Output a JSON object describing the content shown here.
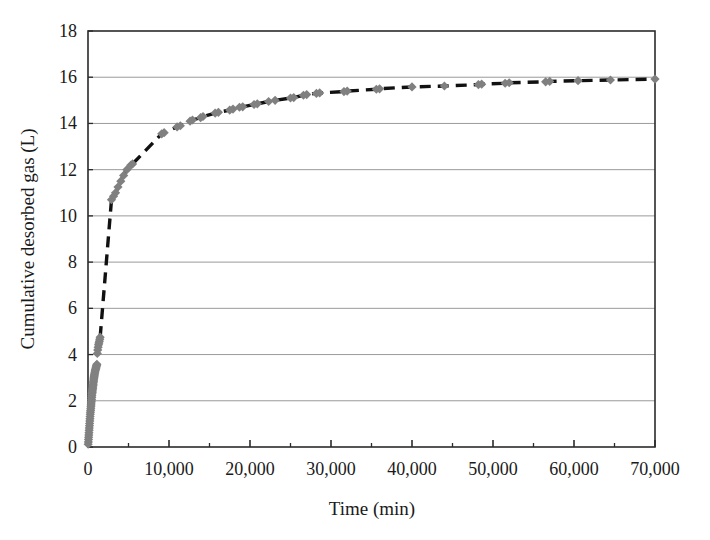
{
  "chart_data": {
    "type": "scatter",
    "title": "",
    "xlabel": "Time (min)",
    "ylabel": "Cumulative desorbed gas (L)",
    "xlim": [
      0,
      70000
    ],
    "ylim": [
      0,
      18
    ],
    "xticks": [
      0,
      10000,
      20000,
      30000,
      40000,
      50000,
      60000,
      70000
    ],
    "xtick_labels": [
      "0",
      "10,000",
      "20,000",
      "30,000",
      "40,000",
      "50,000",
      "60,000",
      "70,000"
    ],
    "xminor_tick_step": 5000,
    "yticks": [
      0,
      2,
      4,
      6,
      8,
      10,
      12,
      14,
      16,
      18
    ],
    "ytick_labels": [
      "0",
      "2",
      "4",
      "6",
      "8",
      "10",
      "12",
      "14",
      "16",
      "18"
    ],
    "grid": "horizontal",
    "grid_color": "#808080",
    "legend": "none",
    "marker": "diamond",
    "marker_color": "#808080",
    "line_style": "dashed",
    "line_color": "#111111",
    "series": [
      {
        "name": "Cumulative desorbed gas",
        "x": [
          20,
          40,
          60,
          80,
          100,
          120,
          140,
          160,
          180,
          200,
          220,
          240,
          260,
          280,
          300,
          320,
          340,
          360,
          380,
          400,
          420,
          440,
          460,
          480,
          500,
          520,
          540,
          560,
          580,
          600,
          620,
          640,
          660,
          680,
          700,
          720,
          740,
          760,
          780,
          800,
          830,
          860,
          890,
          920,
          950,
          980,
          1010,
          1040,
          1070,
          1100,
          1150,
          1200,
          1250,
          1300,
          1350,
          1400,
          1450,
          1500,
          2900,
          3150,
          3400,
          3700,
          4050,
          4400,
          4800,
          5300,
          5500,
          9100,
          9400,
          11000,
          11400,
          12600,
          12900,
          13900,
          14200,
          15700,
          16100,
          17500,
          17900,
          18700,
          19100,
          20500,
          20900,
          22300,
          23100,
          25000,
          25400,
          26600,
          27000,
          28200,
          28600,
          31600,
          32000,
          35600,
          36000,
          40000,
          44000,
          48200,
          48600,
          51500,
          52000,
          56500,
          57000,
          60500,
          64500,
          70000
        ],
        "y": [
          0.12,
          0.22,
          0.32,
          0.42,
          0.52,
          0.62,
          0.72,
          0.82,
          0.92,
          1.02,
          1.12,
          1.22,
          1.32,
          1.42,
          1.5,
          1.58,
          1.66,
          1.74,
          1.82,
          1.9,
          1.98,
          2.06,
          2.14,
          2.22,
          2.3,
          2.36,
          2.42,
          2.48,
          2.54,
          2.6,
          2.66,
          2.72,
          2.78,
          2.84,
          2.9,
          2.95,
          3.0,
          3.05,
          3.1,
          3.15,
          3.2,
          3.25,
          3.3,
          3.34,
          3.38,
          3.42,
          3.46,
          3.5,
          3.54,
          3.58,
          4.05,
          4.2,
          4.32,
          4.42,
          4.5,
          4.58,
          4.66,
          4.75,
          10.7,
          10.85,
          11.0,
          11.25,
          11.5,
          11.75,
          12.0,
          12.2,
          12.25,
          13.55,
          13.6,
          13.85,
          13.9,
          14.1,
          14.15,
          14.25,
          14.3,
          14.45,
          14.48,
          14.58,
          14.62,
          14.7,
          14.72,
          14.82,
          14.85,
          14.95,
          15.0,
          15.1,
          15.12,
          15.22,
          15.25,
          15.3,
          15.32,
          15.38,
          15.4,
          15.48,
          15.5,
          15.58,
          15.62,
          15.68,
          15.7,
          15.74,
          15.76,
          15.8,
          15.82,
          15.85,
          15.88,
          15.92
        ]
      }
    ]
  },
  "plot_geometry": {
    "left": 88,
    "right": 655,
    "top": 31,
    "bottom": 447
  }
}
